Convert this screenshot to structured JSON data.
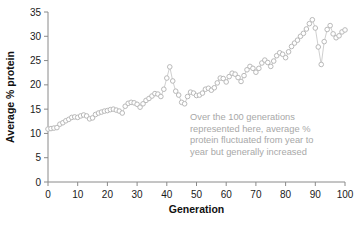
{
  "chart_data": {
    "type": "scatter",
    "title": "",
    "xlabel": "Generation",
    "ylabel": "Average % protein",
    "xlim": [
      0,
      100
    ],
    "ylim": [
      0,
      35
    ],
    "xticks": [
      0,
      10,
      20,
      30,
      40,
      50,
      60,
      70,
      80,
      90,
      100
    ],
    "yticks": [
      0,
      5,
      10,
      15,
      20,
      25,
      30,
      35
    ],
    "grid": false,
    "legend": null,
    "marker": "open-circle",
    "marker_color": "#b9b9b9",
    "line_color": "#c3c3c3",
    "annotation": {
      "lines": [
        "Over the 100 generations",
        "represented here, average %",
        "protein fluctuated from year to",
        "year but generally increased"
      ],
      "color": "#a8a8a8"
    },
    "x": [
      0,
      1,
      2,
      3,
      4,
      5,
      6,
      7,
      8,
      9,
      10,
      11,
      12,
      13,
      14,
      15,
      16,
      17,
      18,
      19,
      20,
      21,
      22,
      23,
      24,
      25,
      26,
      27,
      28,
      29,
      30,
      31,
      32,
      33,
      34,
      35,
      36,
      37,
      38,
      39,
      40,
      41,
      42,
      43,
      44,
      45,
      46,
      47,
      48,
      49,
      50,
      51,
      52,
      53,
      54,
      55,
      56,
      57,
      58,
      59,
      60,
      61,
      62,
      63,
      64,
      65,
      66,
      67,
      68,
      69,
      70,
      71,
      72,
      73,
      74,
      75,
      76,
      77,
      78,
      79,
      80,
      81,
      82,
      83,
      84,
      85,
      86,
      87,
      88,
      89,
      90,
      91,
      92,
      93,
      94,
      95,
      96,
      97,
      98,
      99,
      100
    ],
    "values": [
      10.9,
      11.0,
      11.1,
      11.2,
      11.9,
      12.2,
      12.6,
      12.9,
      13.3,
      13.4,
      13.3,
      13.6,
      13.8,
      13.6,
      13.0,
      13.2,
      13.9,
      14.2,
      14.4,
      14.6,
      14.7,
      14.9,
      15.0,
      14.8,
      14.6,
      14.2,
      15.6,
      16.2,
      16.4,
      16.3,
      16.0,
      15.4,
      16.1,
      16.8,
      17.2,
      17.7,
      18.2,
      18.1,
      17.6,
      19.1,
      21.4,
      23.7,
      20.8,
      18.7,
      17.9,
      16.4,
      16.1,
      17.6,
      18.5,
      18.3,
      17.8,
      17.9,
      18.3,
      19.1,
      19.3,
      18.9,
      19.4,
      20.4,
      21.4,
      21.3,
      20.6,
      21.7,
      22.4,
      22.2,
      21.5,
      20.7,
      21.9,
      23.1,
      23.8,
      23.4,
      22.6,
      23.4,
      24.5,
      25.1,
      24.6,
      23.8,
      24.9,
      26.0,
      26.6,
      26.3,
      25.6,
      26.8,
      27.9,
      28.6,
      29.2,
      30.0,
      30.6,
      31.5,
      32.6,
      33.4,
      31.7,
      27.8,
      24.2,
      28.9,
      31.4,
      32.2,
      30.5,
      29.7,
      30.1,
      30.9,
      31.3
    ]
  }
}
